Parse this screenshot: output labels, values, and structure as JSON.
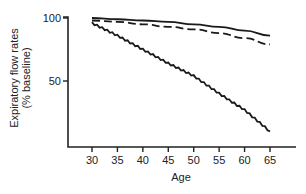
{
  "chart_data": {
    "type": "line",
    "title": "",
    "xlabel": "Age",
    "ylabel": "Expiratory flow rates (% baseline)",
    "ylabel_lines": [
      "Expiratory flow rates",
      "(% baseline)"
    ],
    "x": [
      30,
      35,
      40,
      45,
      50,
      55,
      60,
      65
    ],
    "xticks": [
      "30",
      "35",
      "40",
      "45",
      "50",
      "55",
      "60",
      "65"
    ],
    "yticks": [
      "50",
      "100"
    ],
    "xlim": [
      25,
      70
    ],
    "ylim": [
      0,
      100
    ],
    "grid": false,
    "legend": null,
    "series": [
      {
        "name": "solid",
        "style": "solid",
        "values": [
          100,
          99,
          98,
          97,
          95,
          93,
          90,
          86
        ]
      },
      {
        "name": "dashed",
        "style": "dashed",
        "values": [
          98,
          97,
          95,
          93,
          91,
          88,
          84,
          79
        ]
      },
      {
        "name": "jagged",
        "style": "solid-jagged",
        "values": [
          96,
          86,
          75,
          64,
          54,
          40,
          27,
          10
        ]
      }
    ]
  },
  "axes": {
    "ylabel_line1": "Expiratory flow rates",
    "ylabel_line2": "(% baseline)",
    "xlabel": "Age"
  }
}
